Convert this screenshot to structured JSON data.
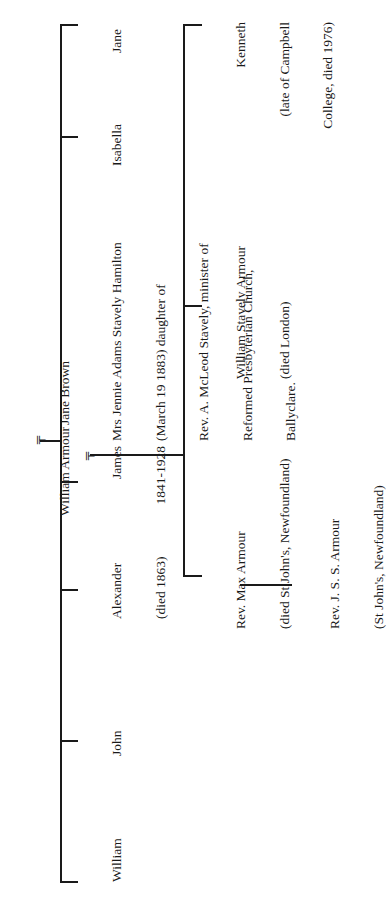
{
  "diagram": {
    "type": "family-tree",
    "orientation": "rotated 90deg counter-clockwise",
    "marriage_symbol": "╤",
    "parents": {
      "father": "William Armour",
      "mother": "Jane Brown"
    },
    "children": [
      {
        "name": "William",
        "lines": [
          "William"
        ]
      },
      {
        "name": "John",
        "lines": [
          "John"
        ]
      },
      {
        "name": "Alexander",
        "lines": [
          "Alexander",
          "(died 1863)"
        ]
      },
      {
        "name": "James",
        "lines": [
          "James",
          "1841-1928"
        ]
      },
      {
        "name": "Isabella",
        "lines": [
          "Isabella"
        ]
      },
      {
        "name": "Jane",
        "lines": [
          "Jane"
        ]
      }
    ],
    "james_spouse": {
      "lines": [
        "Mrs Jennie Adams Stavely Hamilton",
        "(March 19 1883) daughter of",
        "Rev. A. McLeod Stavely, minister of",
        "Reformed Presbyterian Church,",
        "Ballyclare."
      ]
    },
    "grandchildren": [
      {
        "name": "Rev. Max Armour",
        "lines": [
          "Rev. Max Armour",
          "(died St John's, Newfoundland)"
        ]
      },
      {
        "name": "William Stavely Armour",
        "lines": [
          "William Stavely Armour",
          "(died London)"
        ]
      },
      {
        "name": "Kenneth",
        "lines": [
          "Kenneth",
          "(late of Campbell",
          "College, died 1976)"
        ]
      }
    ],
    "great_grandchildren": [
      {
        "name": "Rev. J. S. S. Armour",
        "lines": [
          "Rev. J. S. S. Armour",
          "(St John's, Newfoundland)"
        ]
      }
    ]
  }
}
